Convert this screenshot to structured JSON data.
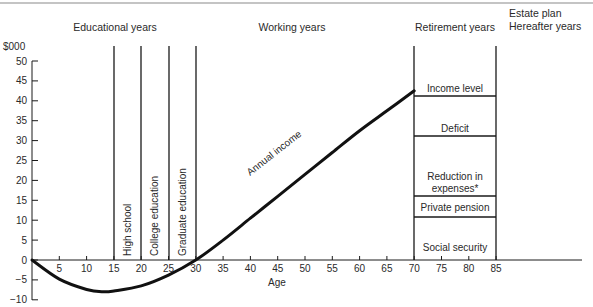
{
  "chart_data": {
    "type": "line",
    "title": "",
    "xlabel": "Age",
    "ylabel": "$000",
    "xlim": [
      0,
      85
    ],
    "ylim": [
      -10,
      50
    ],
    "x_ticks": [
      5,
      10,
      15,
      20,
      25,
      30,
      35,
      40,
      45,
      50,
      55,
      60,
      65,
      70,
      75,
      80,
      85
    ],
    "y_ticks": [
      50,
      45,
      40,
      35,
      30,
      25,
      20,
      15,
      10,
      5,
      0,
      -5,
      -10
    ],
    "y_tick_labels": [
      "50",
      "45",
      "40",
      "35",
      "30",
      "25",
      "20",
      "15",
      "10",
      "5",
      "0",
      "−5",
      "−10"
    ],
    "grid": false,
    "legend": null,
    "series": [
      {
        "name": "Annual income",
        "x": [
          0,
          5,
          10,
          13,
          15,
          20,
          25,
          30,
          35,
          40,
          45,
          50,
          55,
          60,
          65,
          70
        ],
        "y": [
          0,
          -4.8,
          -7.4,
          -8,
          -7.8,
          -6.5,
          -3.8,
          0,
          5,
          10.5,
          16,
          21.5,
          27,
          32.5,
          37.5,
          42.5
        ]
      }
    ],
    "life_stages": [
      {
        "label": "Educational years",
        "x_center": 17
      },
      {
        "label": "Working years",
        "x_center": 48
      },
      {
        "label": "Retirement years",
        "x_center": 77.5
      },
      {
        "label": "Estate plan\nHereafter years",
        "x_center": 93
      }
    ],
    "education_periods": [
      {
        "label": "High school",
        "x_start": 15,
        "x_end": 20
      },
      {
        "label": "College education",
        "x_start": 20,
        "x_end": 25
      },
      {
        "label": "Graduate education",
        "x_start": 25,
        "x_end": 30
      }
    ],
    "retirement_stack": {
      "x_start": 70,
      "x_end": 85,
      "segments": [
        {
          "label": "Social security",
          "y_bottom": 0,
          "y_top": 11
        },
        {
          "label": "Private pension",
          "y_bottom": 11,
          "y_top": 16
        },
        {
          "label": "Reduction in expenses*",
          "y_bottom": 16,
          "y_top": 31
        },
        {
          "label": "Deficit",
          "y_bottom": 31,
          "y_top": 41
        },
        {
          "label": "Income level",
          "y_bottom": 41,
          "y_top": 46
        }
      ]
    },
    "annotations": [
      "Annual income"
    ]
  },
  "labels": {
    "y_unit": "$000",
    "x_axis": "Age",
    "stage_educational": "Educational years",
    "stage_working": "Working years",
    "stage_retirement": "Retirement years",
    "stage_estate_line1": "Estate plan",
    "stage_estate_line2": "Hereafter years",
    "edu_high_school": "High school",
    "edu_college": "College education",
    "edu_graduate": "Graduate education",
    "curve_label": "Annual income",
    "ret_income_level": "Income level",
    "ret_deficit": "Deficit",
    "ret_reduction_line1": "Reduction in",
    "ret_reduction_line2": "expenses*",
    "ret_private_pension": "Private pension",
    "ret_social_security": "Social security"
  },
  "colors": {
    "ink": "#1a1a1a",
    "text": "#2a2a2a",
    "rule": "#8a8a8a",
    "background": "#ffffff"
  }
}
